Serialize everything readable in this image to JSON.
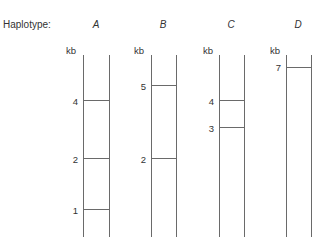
{
  "title": "Haplotype:",
  "unit": "kb",
  "haplotypes": [
    {
      "label": "A",
      "bands": [
        "4",
        "2",
        "1"
      ]
    },
    {
      "label": "B",
      "bands": [
        "5",
        "2"
      ]
    },
    {
      "label": "C",
      "bands": [
        "4",
        "3"
      ]
    },
    {
      "label": "D",
      "bands": [
        "7"
      ]
    }
  ]
}
